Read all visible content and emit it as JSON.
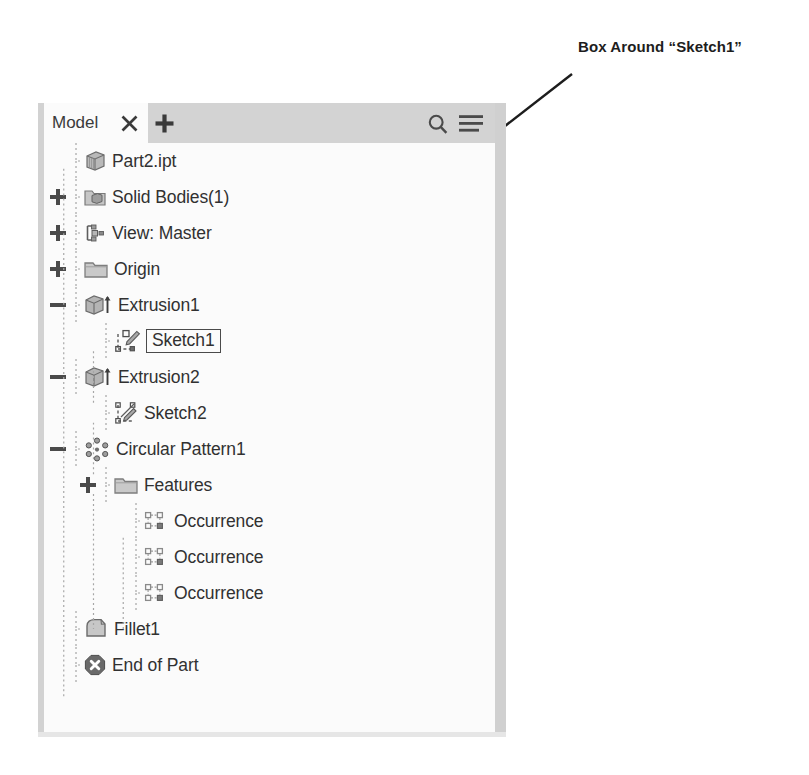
{
  "annotation": {
    "text": "Box Around “Sketch1”",
    "arrow_from": [
      572,
      74
    ],
    "arrow_to": [
      219,
      349
    ],
    "color": "#1d1d1d"
  },
  "panel": {
    "name": "model-browser",
    "background": "#fbfbfb",
    "header_background": "#d3d3d3",
    "tab": {
      "label": "Model",
      "close_icon": "close-icon",
      "add_icon": "plus-icon"
    },
    "tools": {
      "search_icon": "search-icon",
      "menu_icon": "hamburger-menu-icon"
    }
  },
  "tree": {
    "highlighted_node": "Sketch1",
    "nodes": [
      {
        "label": "Part2.ipt",
        "indent": 0,
        "expander": "none",
        "icon": "part-cube-icon",
        "boxed": false
      },
      {
        "label": "Solid Bodies(1)",
        "indent": 0,
        "expander": "plus",
        "icon": "folder-solid-bodies-icon",
        "boxed": false
      },
      {
        "label": "View: Master",
        "indent": 0,
        "expander": "plus",
        "icon": "view-master-icon",
        "boxed": false
      },
      {
        "label": "Origin",
        "indent": 0,
        "expander": "plus",
        "icon": "folder-icon",
        "boxed": false
      },
      {
        "label": "Extrusion1",
        "indent": 0,
        "expander": "minus",
        "icon": "extrusion-icon",
        "boxed": false
      },
      {
        "label": "Sketch1",
        "indent": 1,
        "expander": "none",
        "icon": "sketch-pencil-icon",
        "boxed": true
      },
      {
        "label": "Extrusion2",
        "indent": 0,
        "expander": "minus",
        "icon": "extrusion-icon",
        "boxed": false
      },
      {
        "label": "Sketch2",
        "indent": 1,
        "expander": "none",
        "icon": "sketch-icon",
        "boxed": false
      },
      {
        "label": "Circular Pattern1",
        "indent": 0,
        "expander": "minus",
        "icon": "circular-pattern-icon",
        "boxed": false
      },
      {
        "label": "Features",
        "indent": 1,
        "expander": "plus",
        "icon": "folder-icon",
        "boxed": false
      },
      {
        "label": "Occurrence",
        "indent": 2,
        "expander": "none",
        "icon": "occurrence-icon",
        "boxed": false
      },
      {
        "label": "Occurrence",
        "indent": 2,
        "expander": "none",
        "icon": "occurrence-icon",
        "boxed": false
      },
      {
        "label": "Occurrence",
        "indent": 2,
        "expander": "none",
        "icon": "occurrence-icon",
        "boxed": false
      },
      {
        "label": "Fillet1",
        "indent": 0,
        "expander": "none",
        "icon": "fillet-icon",
        "boxed": false
      },
      {
        "label": "End of Part",
        "indent": 0,
        "expander": "none",
        "icon": "end-of-part-icon",
        "boxed": false
      }
    ]
  }
}
